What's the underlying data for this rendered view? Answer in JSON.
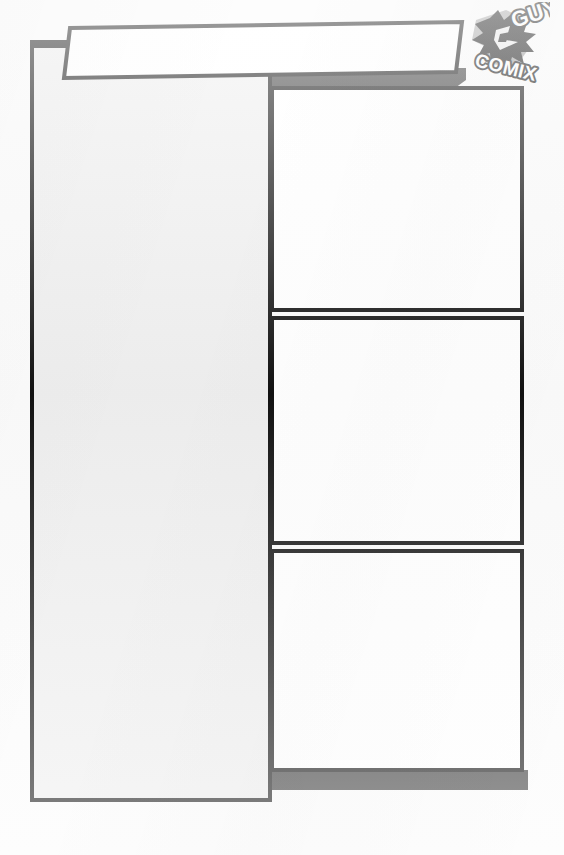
{
  "page": {
    "kind": "comic-page-template",
    "background_color": "#fbfbfb",
    "ink_color": "#111111",
    "shadow_color": "#3a3a3a",
    "panel_fill_white": "#ffffff",
    "panel_fill_gray": "#eeeeee",
    "width": 564,
    "height": 855
  },
  "logo": {
    "name": "guy-comix-logo",
    "word_top": "GUY",
    "word_bottom": "COMIX",
    "splatter_color": "#101010",
    "outline_color": "#ffffff",
    "tint_color": "#9a9a9a"
  },
  "banner": {
    "name": "title-banner",
    "label": "",
    "fill": "#ffffff",
    "stroke": "#111111"
  },
  "panels": [
    {
      "id": "panel-left-tall",
      "label": "",
      "fill": "#eeeeee",
      "stroke": "#111111",
      "x": 32,
      "y": 42,
      "w": 238,
      "h": 758
    },
    {
      "id": "panel-right-1",
      "label": "",
      "fill": "#ffffff",
      "stroke": "#111111",
      "x": 272,
      "y": 88,
      "w": 250,
      "h": 222
    },
    {
      "id": "panel-right-2",
      "label": "",
      "fill": "#ffffff",
      "stroke": "#111111",
      "x": 272,
      "y": 318,
      "w": 250,
      "h": 225
    },
    {
      "id": "panel-right-3",
      "label": "",
      "fill": "#ffffff",
      "stroke": "#111111",
      "x": 272,
      "y": 551,
      "w": 250,
      "h": 219
    }
  ],
  "shadows": [
    {
      "id": "shadow-top-bar",
      "color": "#3a3a3a"
    },
    {
      "id": "shadow-bottom-bar",
      "color": "#3a3a3a"
    }
  ]
}
